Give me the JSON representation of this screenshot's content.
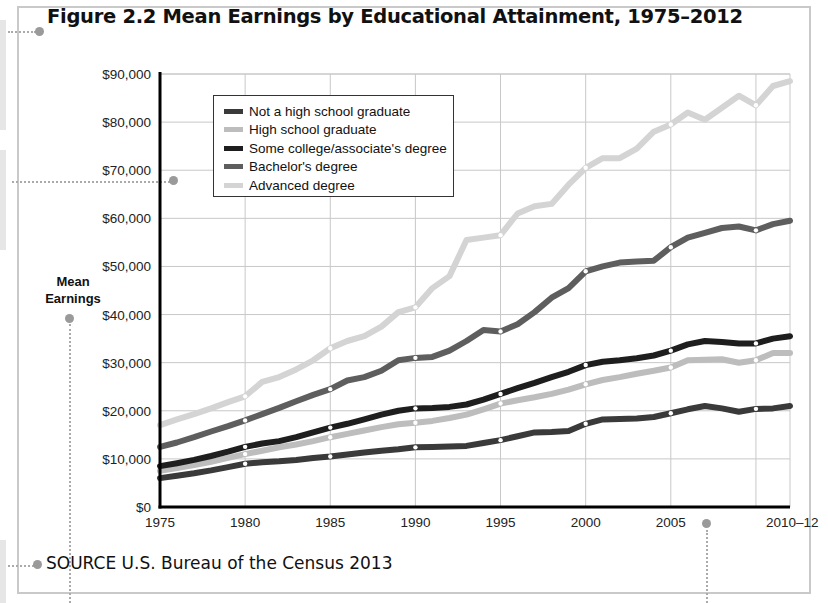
{
  "figure": {
    "title": "Figure 2.2  Mean Earnings by Educational Attainment, 1975–2012",
    "source": "SOURCE  U.S. Bureau of the Census 2013",
    "y_axis_title_line1": "Mean",
    "y_axis_title_line2": "Earnings"
  },
  "legend": {
    "items": [
      {
        "label": "Not a high school graduate",
        "color": "#3a3a3a"
      },
      {
        "label": "High school graduate",
        "color": "#bdbdbd"
      },
      {
        "label": "Some college/associate's degree",
        "color": "#1e1e1e"
      },
      {
        "label": "Bachelor's degree",
        "color": "#5e5e5e"
      },
      {
        "label": "Advanced degree",
        "color": "#d4d4d4"
      }
    ]
  },
  "chart_data": {
    "type": "line",
    "title": "Figure 2.2 Mean Earnings by Educational Attainment, 1975–2012",
    "xlabel": "",
    "ylabel": "Mean Earnings",
    "ylim": [
      0,
      90000
    ],
    "xlim": [
      1975,
      2012
    ],
    "grid": true,
    "legend_position": "upper-left inside",
    "x_tick_labels": [
      "1975",
      "1980",
      "1985",
      "1990",
      "1995",
      "2000",
      "2005",
      "2010–12"
    ],
    "y_tick_labels": [
      "$0",
      "$10,000",
      "$20,000",
      "$30,000",
      "$40,000",
      "$50,000",
      "$60,000",
      "$70,000",
      "$80,000",
      "$90,000"
    ],
    "x": [
      1975,
      1976,
      1977,
      1978,
      1979,
      1980,
      1981,
      1982,
      1983,
      1984,
      1985,
      1986,
      1987,
      1988,
      1989,
      1990,
      1991,
      1992,
      1993,
      1994,
      1995,
      1996,
      1997,
      1998,
      1999,
      2000,
      2001,
      2002,
      2003,
      2004,
      2005,
      2006,
      2007,
      2008,
      2009,
      2010,
      2011,
      2012
    ],
    "series": [
      {
        "name": "Not a high school graduate",
        "color": "#3a3a3a",
        "width": 6,
        "values": [
          6000,
          6500,
          7000,
          7600,
          8300,
          9000,
          9300,
          9500,
          9800,
          10200,
          10500,
          10900,
          11300,
          11700,
          12000,
          12400,
          12500,
          12600,
          12700,
          13300,
          13900,
          14700,
          15500,
          15600,
          15800,
          17300,
          18200,
          18300,
          18400,
          18700,
          19500,
          20300,
          21000,
          20500,
          19800,
          20400,
          20500,
          21000
        ]
      },
      {
        "name": "High school graduate",
        "color": "#bdbdbd",
        "width": 6,
        "values": [
          7500,
          8100,
          8700,
          9400,
          10200,
          11000,
          11700,
          12400,
          13000,
          13700,
          14500,
          15200,
          15900,
          16600,
          17200,
          17500,
          17900,
          18500,
          19200,
          20300,
          21500,
          22200,
          22800,
          23500,
          24400,
          25500,
          26400,
          27000,
          27700,
          28300,
          29000,
          30500,
          30600,
          30700,
          30000,
          30500,
          32000,
          32000
        ]
      },
      {
        "name": "Some college/associate's degree",
        "color": "#1e1e1e",
        "width": 6,
        "values": [
          8500,
          9100,
          9800,
          10600,
          11500,
          12500,
          13200,
          13700,
          14500,
          15500,
          16500,
          17300,
          18200,
          19200,
          20000,
          20500,
          20600,
          20800,
          21300,
          22300,
          23500,
          24700,
          25800,
          27000,
          28100,
          29500,
          30200,
          30500,
          30900,
          31500,
          32500,
          33800,
          34500,
          34300,
          34000,
          34000,
          35000,
          35500
        ]
      },
      {
        "name": "Bachelor's degree",
        "color": "#5e5e5e",
        "width": 6,
        "values": [
          12500,
          13400,
          14500,
          15700,
          16800,
          18000,
          19300,
          20600,
          22000,
          23300,
          24500,
          26300,
          27000,
          28300,
          30500,
          31000,
          31200,
          32500,
          34500,
          36800,
          36500,
          38000,
          40500,
          43500,
          45500,
          49000,
          50000,
          50800,
          51000,
          51200,
          54000,
          56000,
          57000,
          58000,
          58300,
          57500,
          58800,
          59500
        ]
      },
      {
        "name": "Advanced degree",
        "color": "#d4d4d4",
        "width": 6,
        "values": [
          17000,
          18200,
          19300,
          20500,
          21800,
          23000,
          26000,
          27000,
          28600,
          30500,
          33000,
          34500,
          35500,
          37500,
          40500,
          41500,
          45500,
          48000,
          55500,
          56000,
          56500,
          61000,
          62500,
          63000,
          67000,
          70500,
          72500,
          72500,
          74500,
          78000,
          79500,
          82000,
          80500,
          83000,
          85500,
          83500,
          87500,
          88500
        ]
      }
    ]
  }
}
